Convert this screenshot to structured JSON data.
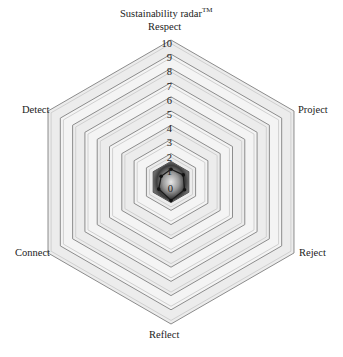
{
  "chart_data": {
    "type": "radar",
    "title": "Sustainability radar",
    "title_mark": "TM",
    "axes": [
      "Respect",
      "Project",
      "Reject",
      "Reflect",
      "Connect",
      "Detect"
    ],
    "scale": {
      "min": 0,
      "max": 10,
      "step": 1
    },
    "tick_labels": [
      "0",
      "1",
      "2",
      "3",
      "4",
      "5",
      "6",
      "7",
      "8",
      "9",
      "10"
    ],
    "series": [
      {
        "name": "Assessment",
        "values": [
          0.9,
          1.0,
          1.1,
          1.3,
          1.0,
          0.8
        ]
      }
    ],
    "grid": true,
    "legend": "none"
  },
  "colors": {
    "grid_line": "#8a8a8a",
    "grid_fill": "#f2f2f2",
    "center_dark": "#3a3a3a",
    "series_line": "#1a1a1a"
  }
}
